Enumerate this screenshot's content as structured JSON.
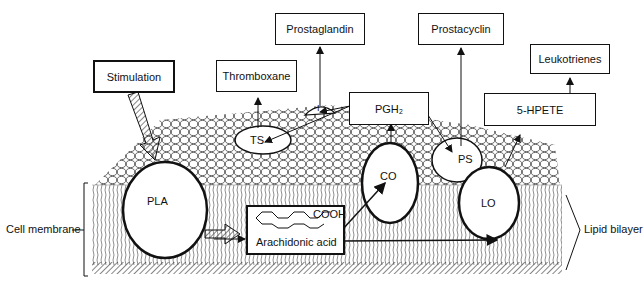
{
  "diagram": {
    "boxes": {
      "stimulation": "Stimulation",
      "thromboxane": "Thromboxane",
      "prostaglandin": "Prostaglandin",
      "prostacyclin": "Prostacyclin",
      "leukotrienes": "Leukotrienes",
      "pgh2": "PGH₂",
      "hpete_line1": "5-HPETE",
      "hpete_line2": "5-HETE",
      "arachidonic": "Arachidonic acid",
      "cooh": "COOH"
    },
    "enzymes": {
      "pla": "PLA",
      "ts": "TS",
      "i": "I",
      "co": "CO",
      "ps": "PS",
      "lo": "LO"
    },
    "labels": {
      "cell_membrane": "Cell membrane",
      "lipid_bilayer": "Lipid bilayer"
    }
  }
}
